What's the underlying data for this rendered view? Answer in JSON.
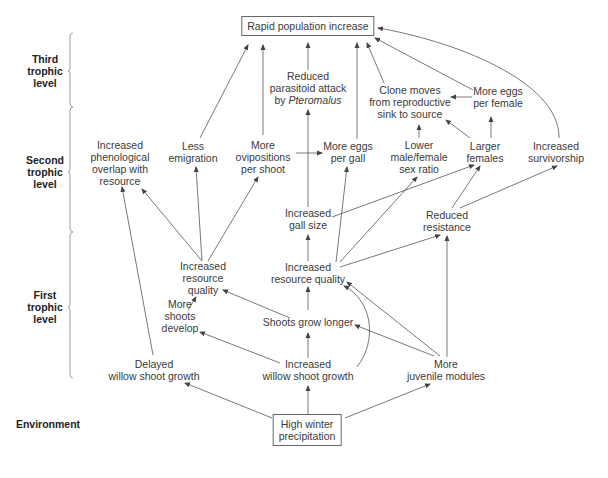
{
  "levels": [
    {
      "id": "third",
      "label": [
        "Third",
        "trophic",
        "level"
      ],
      "x": 64,
      "y": 71,
      "bracket": {
        "top": 33,
        "bottom": 107,
        "mid": 71
      }
    },
    {
      "id": "second",
      "label": [
        "Second",
        "trophic",
        "level"
      ],
      "x": 64,
      "y": 172,
      "bracket": {
        "top": 107,
        "bottom": 232,
        "mid": 172
      }
    },
    {
      "id": "first",
      "label": [
        "First",
        "trophic",
        "level"
      ],
      "x": 64,
      "y": 307,
      "bracket": {
        "top": 232,
        "bottom": 378,
        "mid": 307
      }
    },
    {
      "id": "environment",
      "label": [
        "Environment"
      ],
      "x": 48,
      "y": 424,
      "bracket": null
    }
  ],
  "nodes": [
    {
      "id": "rapid",
      "lines": [
        "Rapid population increase"
      ],
      "x": 308,
      "y": 26,
      "boxed": true
    },
    {
      "id": "reduced_parasitoid",
      "lines": [
        "Reduced",
        "parasitoid attack",
        "by |Pteromalus|"
      ],
      "x": 308,
      "y": 88,
      "boxed": false
    },
    {
      "id": "clone_moves",
      "lines": [
        "Clone moves",
        "from reproductive",
        "sink to source"
      ],
      "x": 410,
      "y": 102,
      "boxed": false
    },
    {
      "id": "more_eggs_female",
      "lines": [
        "More eggs",
        "per female"
      ],
      "x": 498,
      "y": 97,
      "boxed": false
    },
    {
      "id": "phenological",
      "lines": [
        "Increased",
        "phenological",
        "overlap with",
        "resource"
      ],
      "x": 120,
      "y": 163,
      "boxed": false
    },
    {
      "id": "less_emigration",
      "lines": [
        "Less",
        "emigration"
      ],
      "x": 193,
      "y": 152,
      "boxed": false
    },
    {
      "id": "more_ovipositions",
      "lines": [
        "More",
        "ovipositions",
        "per shoot"
      ],
      "x": 263,
      "y": 157,
      "boxed": false
    },
    {
      "id": "more_eggs_gall",
      "lines": [
        "More eggs",
        "per gall"
      ],
      "x": 348,
      "y": 152,
      "boxed": false
    },
    {
      "id": "lower_sex_ratio",
      "lines": [
        "Lower",
        "male/female",
        "sex ratio"
      ],
      "x": 419,
      "y": 157,
      "boxed": false
    },
    {
      "id": "larger_females",
      "lines": [
        "Larger",
        "females"
      ],
      "x": 485,
      "y": 152,
      "boxed": false
    },
    {
      "id": "increased_survivorship",
      "lines": [
        "Increased",
        "survivorship"
      ],
      "x": 556,
      "y": 152,
      "boxed": false
    },
    {
      "id": "increased_gall_size",
      "lines": [
        "Increased",
        "gall size"
      ],
      "x": 308,
      "y": 219,
      "boxed": false
    },
    {
      "id": "reduced_resistance",
      "lines": [
        "Reduced",
        "resistance"
      ],
      "x": 447,
      "y": 221,
      "boxed": false
    },
    {
      "id": "resource_quality_left",
      "lines": [
        "Increased",
        "resource",
        "quality"
      ],
      "x": 203,
      "y": 278,
      "boxed": false
    },
    {
      "id": "resource_quality_main",
      "lines": [
        "Increased",
        "resource quality"
      ],
      "x": 308,
      "y": 273,
      "boxed": false
    },
    {
      "id": "more_shoots",
      "lines": [
        "More",
        "shoots",
        "develop"
      ],
      "x": 180,
      "y": 316,
      "boxed": false
    },
    {
      "id": "shoots_longer",
      "lines": [
        "Shoots grow longer"
      ],
      "x": 308,
      "y": 322,
      "boxed": false
    },
    {
      "id": "delayed_growth",
      "lines": [
        "Delayed",
        "willow shoot growth"
      ],
      "x": 154,
      "y": 370,
      "boxed": false
    },
    {
      "id": "increased_growth",
      "lines": [
        "Increased",
        "willow shoot growth"
      ],
      "x": 308,
      "y": 370,
      "boxed": false
    },
    {
      "id": "juvenile_modules",
      "lines": [
        "More",
        "juvenile modules"
      ],
      "x": 446,
      "y": 370,
      "boxed": false
    },
    {
      "id": "high_precip",
      "lines": [
        "High winter",
        "precipitation"
      ],
      "x": 307,
      "y": 430,
      "boxed": true
    }
  ],
  "edges": [
    {
      "from": "less_emigration",
      "to": "rapid",
      "path": "M200,138 L248,45"
    },
    {
      "from": "more_ovipositions",
      "to": "rapid",
      "path": "M263,135 L263,45"
    },
    {
      "from": "reduced_parasitoid",
      "to": "rapid",
      "path": "M308,70 L308,43"
    },
    {
      "from": "more_eggs_gall",
      "to": "rapid",
      "path": "M357,139 L357,43"
    },
    {
      "from": "clone_moves",
      "to": "rapid",
      "path": "M384,83 L367,43"
    },
    {
      "from": "more_eggs_female",
      "to": "rapid",
      "path": "M473,90 L375,38"
    },
    {
      "from": "increased_survivorship",
      "to": "rapid",
      "path": "M559,138 C560,80 450,40 378,28"
    },
    {
      "from": "more_eggs_female",
      "to": "clone_moves",
      "path": "M472,97 L451,97"
    },
    {
      "from": "lower_sex_ratio",
      "to": "clone_moves",
      "path": "M419,138 L419,125"
    },
    {
      "from": "larger_females",
      "to": "clone_moves",
      "path": "M470,138 L446,120"
    },
    {
      "from": "larger_females",
      "to": "more_eggs_female",
      "path": "M491,138 L491,117"
    },
    {
      "from": "more_ovipositions",
      "to": "more_eggs_gall",
      "path": "M296,153 L322,153"
    },
    {
      "from": "increased_gall_size",
      "to": "reduced_parasitoid",
      "path": "M308,207 L308,110"
    },
    {
      "from": "increased_gall_size",
      "to": "larger_females",
      "path": "M332,217 L474,165"
    },
    {
      "from": "resource_quality_main",
      "to": "increased_gall_size",
      "path": "M308,261 L308,235"
    },
    {
      "from": "resource_quality_main",
      "to": "more_eggs_gall",
      "path": "M336,262 L347,167"
    },
    {
      "from": "resource_quality_main",
      "to": "lower_sex_ratio",
      "path": "M340,262 L417,177"
    },
    {
      "from": "resource_quality_main",
      "to": "reduced_resistance",
      "path": "M340,267 L440,235"
    },
    {
      "from": "reduced_resistance",
      "to": "larger_females",
      "path": "M452,208 L480,166"
    },
    {
      "from": "reduced_resistance",
      "to": "increased_survivorship",
      "path": "M460,208 L557,166"
    },
    {
      "from": "resource_quality_left",
      "to": "phenological",
      "path": "M202,261 L142,189"
    },
    {
      "from": "resource_quality_left",
      "to": "less_emigration",
      "path": "M202,261 L196,167"
    },
    {
      "from": "resource_quality_left",
      "to": "more_ovipositions",
      "path": "M208,261 L258,177"
    },
    {
      "from": "delayed_growth",
      "to": "phenological",
      "path": "M153,355 L122,187"
    },
    {
      "from": "more_shoots",
      "to": "resource_quality_left",
      "path": "M188,310 L196,297"
    },
    {
      "from": "shoots_longer",
      "to": "resource_quality_left",
      "path": "M290,318 L223,290"
    },
    {
      "from": "shoots_longer",
      "to": "resource_quality_main",
      "path": "M308,310 L308,287"
    },
    {
      "from": "increased_growth",
      "to": "shoots_longer",
      "path": "M308,358 L308,333"
    },
    {
      "from": "increased_growth",
      "to": "more_shoots",
      "path": "M280,363 L200,332"
    },
    {
      "from": "increased_growth",
      "to": "resource_quality_main",
      "path": "M357,367 C378,340 372,300 344,286"
    },
    {
      "from": "juvenile_modules",
      "to": "shoots_longer",
      "path": "M434,356 L355,325"
    },
    {
      "from": "juvenile_modules",
      "to": "resource_quality_main",
      "path": "M440,356 L347,282"
    },
    {
      "from": "juvenile_modules",
      "to": "reduced_resistance",
      "path": "M447,357 L447,236"
    },
    {
      "from": "high_precip",
      "to": "delayed_growth",
      "path": "M272,418 L185,383"
    },
    {
      "from": "high_precip",
      "to": "increased_growth",
      "path": "M308,414 L308,386"
    },
    {
      "from": "high_precip",
      "to": "juvenile_modules",
      "path": "M345,418 L430,384"
    }
  ],
  "colors": {
    "line": "#555555",
    "text": "#3a3a3a",
    "box_border": "#666666",
    "label": "#222222",
    "bracket": "#888888"
  }
}
